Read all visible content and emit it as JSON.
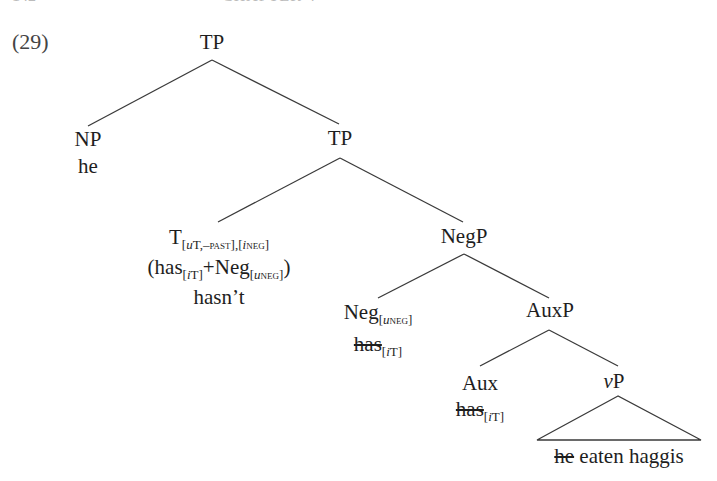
{
  "page_header": {
    "page_number": "142",
    "running_head": "CHAPTER 4"
  },
  "example": {
    "number": "(29)"
  },
  "tree": {
    "root": {
      "label": "TP"
    },
    "np": {
      "label": "NP",
      "word": "he"
    },
    "tp2": {
      "label": "TP"
    },
    "t_head": {
      "label": "T",
      "features_1_u": "u",
      "features_1_rest": "T,",
      "features_1_past": "–past",
      "features_sep": ",",
      "features_2_i": "i",
      "features_2_neg": "neg",
      "paren_open": "(",
      "has": "has",
      "has_feat_i": "i",
      "has_feat_T": "T",
      "plus": "+",
      "neg": "Neg",
      "neg_feat_u": "u",
      "neg_feat_neg": "neg",
      "paren_close": ")",
      "word": "hasn’t"
    },
    "negp": {
      "label": "NegP"
    },
    "neg_head": {
      "label": "Neg",
      "feat_u": "u",
      "feat_neg": "neg",
      "trace": "has",
      "trace_feat_i": "i",
      "trace_feat_T": "T"
    },
    "auxp": {
      "label": "AuxP"
    },
    "aux_head": {
      "label": "Aux",
      "trace": "has",
      "trace_feat_i": "i",
      "trace_feat_T": "T"
    },
    "vp": {
      "label_v": "v",
      "label_p": "P",
      "deleted_subject": "he",
      "words": " eaten haggis"
    }
  }
}
